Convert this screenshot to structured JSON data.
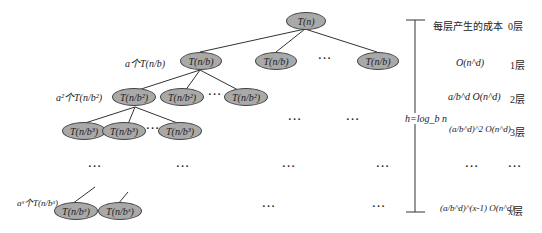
{
  "diagram": {
    "root": {
      "label": "T(n)"
    },
    "level1": {
      "annotation": "a个T(n/b)",
      "nodes": [
        "T(n/b)",
        "T(n/b)",
        "T(n/b)"
      ],
      "ellipsis": "···"
    },
    "level2": {
      "annotation": "a²个T(n/b²)",
      "nodes": [
        "T(n/b²)",
        "T(n/b²)",
        "T(n/b²)"
      ],
      "ellipsis": "···"
    },
    "level3": {
      "nodes": [
        "T(n/b³)",
        "T(n/b³)",
        "T(n/b³)"
      ],
      "ellipsis": "···"
    },
    "last_level": {
      "annotation": "aˣ个T(n/bˣ)",
      "nodes": [
        "T(n/bˣ)",
        "T(n/bˣ)"
      ]
    },
    "height_label": "h=log_b n",
    "ellipsis": "···"
  },
  "cost_column": {
    "header": "每层产生的成本",
    "rows": [
      {
        "cost": "",
        "level": "0层"
      },
      {
        "cost": "O(n^d)",
        "level": "1层"
      },
      {
        "cost": "a/b^d O(n^d)",
        "level": "2层"
      },
      {
        "cost": "(a/b^d)^2 O(n^d)",
        "level": "3层"
      },
      {
        "cost": "···",
        "level": "···"
      },
      {
        "cost": "(a/b^d)^(x-1) O(n^d)",
        "level": "x层"
      }
    ]
  },
  "colors": {
    "node_fill": "#a9a9a9",
    "stroke": "#333333",
    "background": "#ffffff"
  }
}
